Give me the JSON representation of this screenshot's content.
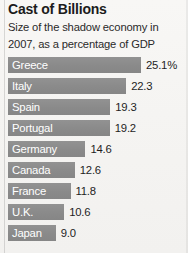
{
  "chart_data": {
    "type": "bar",
    "title": "Cast of Billions",
    "subtitle": "Size of the shadow economy in 2007, as a percentage of GDP",
    "orientation": "horizontal",
    "xlabel": "",
    "ylabel": "",
    "grid": false,
    "legend": null,
    "unit": "% of GDP",
    "xlim": [
      0,
      25.1
    ],
    "categories": [
      "Greece",
      "Italy",
      "Spain",
      "Portugal",
      "Germany",
      "Canada",
      "France",
      "U.K.",
      "Japan"
    ],
    "values": [
      25.1,
      22.3,
      19.3,
      19.2,
      14.6,
      12.6,
      11.8,
      10.6,
      9.0
    ],
    "value_labels": [
      "25.1%",
      "22.3",
      "19.3",
      "19.2",
      "14.6",
      "12.6",
      "11.8",
      "10.6",
      "9.0"
    ],
    "bars": [
      {
        "label": "Greece",
        "value": 25.1,
        "value_label": "25.1%"
      },
      {
        "label": "Italy",
        "value": 22.3,
        "value_label": "22.3"
      },
      {
        "label": "Spain",
        "value": 19.3,
        "value_label": "19.3"
      },
      {
        "label": "Portugal",
        "value": 19.2,
        "value_label": "19.2"
      },
      {
        "label": "Germany",
        "value": 14.6,
        "value_label": "14.6"
      },
      {
        "label": "Canada",
        "value": 12.6,
        "value_label": "12.6"
      },
      {
        "label": "France",
        "value": 11.8,
        "value_label": "11.8"
      },
      {
        "label": "U.K.",
        "value": 10.6,
        "value_label": "10.6"
      },
      {
        "label": "Japan",
        "value": 9.0,
        "value_label": "9.0"
      }
    ],
    "colors": {
      "bar": "#8a8a8a",
      "background": "#f5f4f2",
      "bar_label_text": "#ffffff",
      "value_text": "#1e1e1e",
      "title_text": "#1c1c1c"
    }
  }
}
